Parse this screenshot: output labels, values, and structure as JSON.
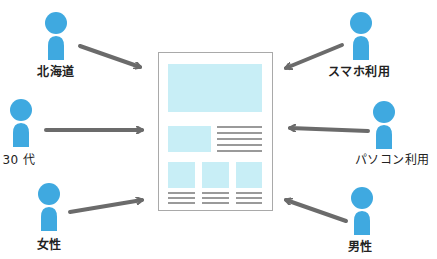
{
  "diagram": {
    "colors": {
      "person": "#3fa9e0",
      "arrow": "#6b6b6b",
      "page_border": "#a9a9a9",
      "page_block": "#c8eef6",
      "page_text_line": "#9a9a9a"
    },
    "segments": [
      {
        "id": "hokkaido",
        "label": "北海道",
        "side": "left",
        "row": "top"
      },
      {
        "id": "30s",
        "label": "30 代",
        "side": "left",
        "row": "middle"
      },
      {
        "id": "female",
        "label": "女性",
        "side": "left",
        "row": "bottom"
      },
      {
        "id": "smartphone",
        "label": "スマホ利用",
        "side": "right",
        "row": "top"
      },
      {
        "id": "pc",
        "label": "パソコン利用",
        "side": "right",
        "row": "middle"
      },
      {
        "id": "male",
        "label": "男性",
        "side": "right",
        "row": "bottom"
      }
    ],
    "page": {
      "icon": "web-page-wireframe-icon",
      "blocks": [
        "hero-image",
        "side-image",
        "thumb-1",
        "thumb-2",
        "thumb-3"
      ]
    }
  }
}
